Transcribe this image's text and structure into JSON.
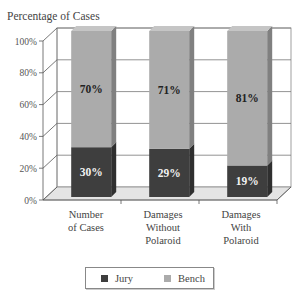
{
  "chart_data": {
    "type": "bar",
    "stacked": true,
    "three_d": true,
    "title": "Percentage of Cases",
    "xlabel": "",
    "ylabel": "Percentage of Cases",
    "ylim": [
      0,
      100
    ],
    "y_ticks": [
      "0%",
      "20%",
      "40%",
      "60%",
      "80%",
      "100%"
    ],
    "grid": true,
    "legend_position": "bottom",
    "categories": [
      "Number of Cases",
      "Damages Without Polaroid",
      "Damages With Polaroid"
    ],
    "category_lines": [
      [
        "Number",
        "of Cases"
      ],
      [
        "Damages",
        "Without",
        "Polaroid"
      ],
      [
        "Damages",
        "With",
        "Polaroid"
      ]
    ],
    "series": [
      {
        "name": "Jury",
        "values": [
          30,
          29,
          19
        ],
        "labels": [
          "30%",
          "29%",
          "19%"
        ],
        "color": "#3e3e3e"
      },
      {
        "name": "Bench",
        "values": [
          70,
          71,
          81
        ],
        "labels": [
          "70%",
          "71%",
          "81%"
        ],
        "color": "#ababab"
      }
    ]
  },
  "legend": {
    "items": [
      {
        "label": "Jury",
        "color": "#3e3e3e"
      },
      {
        "label": "Bench",
        "color": "#ababab"
      }
    ]
  }
}
